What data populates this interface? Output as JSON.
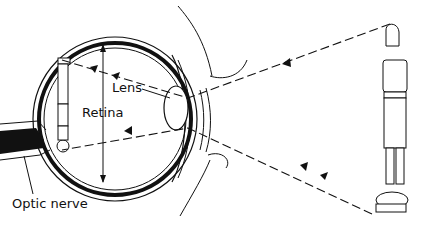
{
  "diagram": {
    "labels": {
      "lens": "Lens",
      "retina": "Retina",
      "optic_nerve": "Optic nerve"
    },
    "colors": {
      "ink": "#111111",
      "background": "#ffffff"
    },
    "elements": [
      "eyeball-cross-section",
      "lens",
      "retina",
      "optic-nerve",
      "eyelids",
      "inverted-image-of-person",
      "person-on-skateboard",
      "light-ray-top",
      "light-ray-bottom"
    ]
  }
}
